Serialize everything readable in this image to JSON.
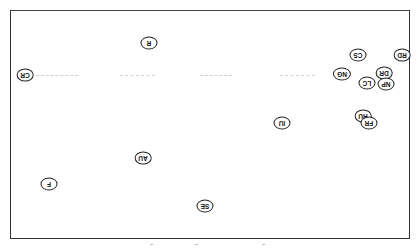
{
  "chart_data": {
    "type": "scatter",
    "title": "",
    "xlabel": "",
    "ylabel": "",
    "orientation": "rotated 180 degrees (labels upside-down)",
    "grid": false,
    "legend": null,
    "points": [
      {
        "label": "R",
        "x": 149,
        "y": 43
      },
      {
        "label": "CR",
        "x": 25,
        "y": 75
      },
      {
        "label": "CS",
        "x": 358,
        "y": 55
      },
      {
        "label": "RD",
        "x": 402,
        "y": 55
      },
      {
        "label": "NG",
        "x": 342,
        "y": 74
      },
      {
        "label": "DR",
        "x": 384,
        "y": 73
      },
      {
        "label": "LC",
        "x": 367,
        "y": 83
      },
      {
        "label": "NP",
        "x": 386,
        "y": 84
      },
      {
        "label": "IU",
        "x": 282,
        "y": 123
      },
      {
        "label": "HU",
        "x": 363,
        "y": 116
      },
      {
        "label": "FR",
        "x": 369,
        "y": 123
      },
      {
        "label": "AU",
        "x": 143,
        "y": 158
      },
      {
        "label": "F",
        "x": 49,
        "y": 184
      },
      {
        "label": "SE",
        "x": 205,
        "y": 206
      }
    ],
    "reference_line": {
      "style": "dashed",
      "y": 75,
      "x_from": 35,
      "x_to": 330
    }
  }
}
